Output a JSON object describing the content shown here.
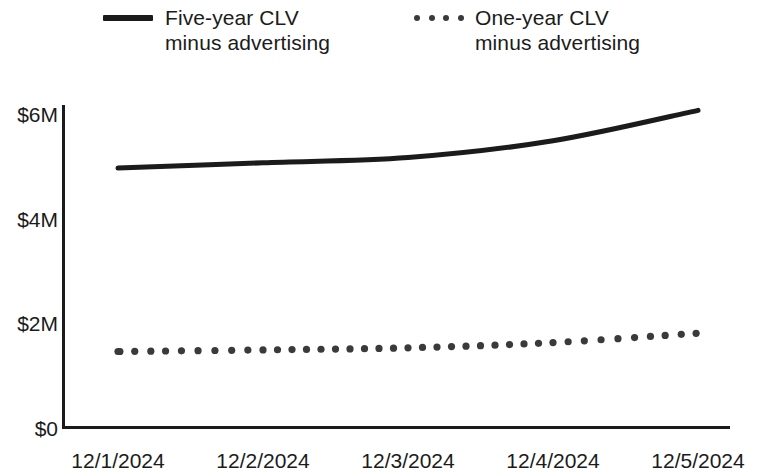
{
  "legend": {
    "position": "top",
    "entries": [
      {
        "label": "Five-year CLV\nminus advertising",
        "style": "solid",
        "color": "#1b1b1b",
        "marker_name": "solid-line-swatch"
      },
      {
        "label": "One-year CLV\nminus advertising",
        "style": "dotted",
        "color": "#3a3a3a",
        "marker_name": "dotted-line-swatch"
      }
    ]
  },
  "axes": {
    "y_ticks": [
      "$0",
      "$2M",
      "$4M",
      "$6M"
    ],
    "x_ticks": [
      "12/1/2024",
      "12/2/2024",
      "12/3/2024",
      "12/4/2024",
      "12/5/2024"
    ]
  },
  "chart_data": {
    "type": "line",
    "title": "",
    "subtitle": "",
    "xlabel": "",
    "ylabel": "",
    "x": [
      "12/1/2024",
      "12/2/2024",
      "12/3/2024",
      "12/4/2024",
      "12/5/2024"
    ],
    "categories": [
      "12/1/2024",
      "12/2/2024",
      "12/3/2024",
      "12/4/2024",
      "12/5/2024"
    ],
    "series": [
      {
        "name": "Five-year CLV minus advertising",
        "style": "solid",
        "color": "#1b1b1b",
        "values": [
          4950000,
          5050000,
          5150000,
          5470000,
          6050000
        ],
        "values_millions": [
          4.95,
          5.05,
          5.15,
          5.47,
          6.05
        ]
      },
      {
        "name": "One-year CLV minus advertising",
        "style": "dotted",
        "color": "#3a3a3a",
        "values": [
          1450000,
          1480000,
          1520000,
          1620000,
          1800000
        ],
        "values_millions": [
          1.45,
          1.48,
          1.52,
          1.62,
          1.8
        ]
      }
    ],
    "ylim": [
      0,
      6600000
    ],
    "ytick_values": [
      0,
      2000000,
      4000000,
      6000000
    ],
    "ytick_labels": [
      "$0",
      "$2M",
      "$4M",
      "$6M"
    ],
    "xtick_labels": [
      "12/1/2024",
      "12/2/2024",
      "12/3/2024",
      "12/4/2024",
      "12/5/2024"
    ],
    "grid": false,
    "legend_position": "top",
    "axis_color": "#1b1b1b",
    "background": "#ffffff"
  }
}
